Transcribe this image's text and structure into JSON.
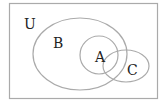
{
  "diagram": {
    "type": "venn",
    "universe_label": "U",
    "sets": [
      {
        "id": "B",
        "label": "B"
      },
      {
        "id": "A",
        "label": "A"
      },
      {
        "id": "C",
        "label": "C"
      }
    ],
    "stroke_color": "#aaaaaa",
    "text_color": "#222222"
  }
}
